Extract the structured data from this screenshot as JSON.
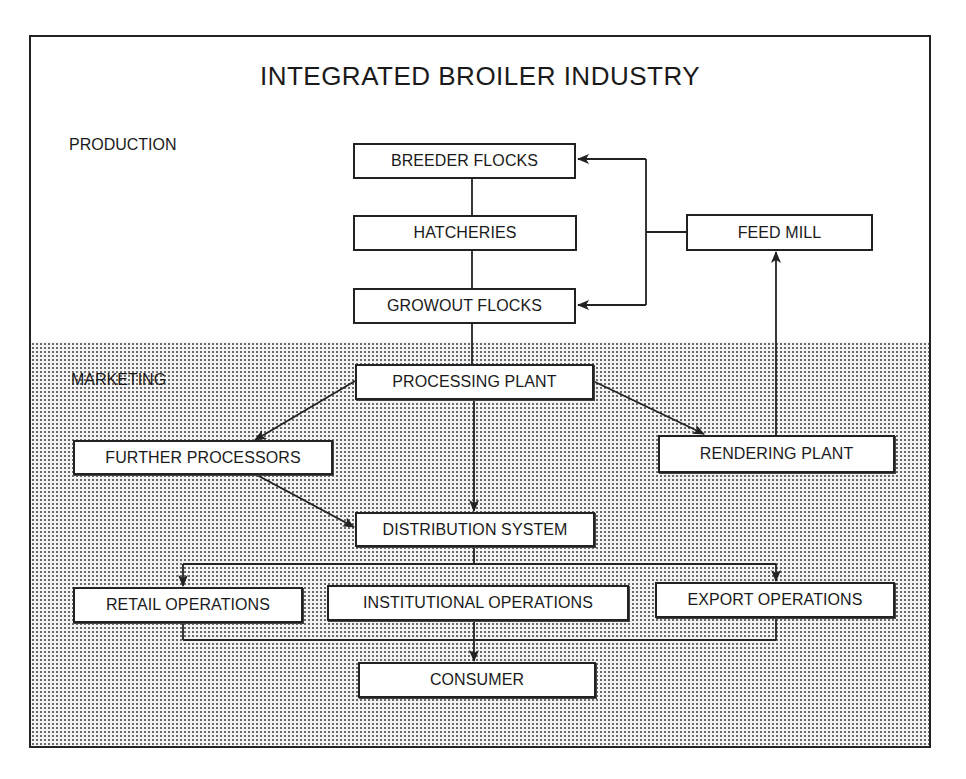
{
  "diagram": {
    "title": "INTEGRATED BROILER INDUSTRY",
    "sections": {
      "production": "PRODUCTION",
      "marketing": "MARKETING"
    },
    "nodes": {
      "breeder_flocks": "BREEDER FLOCKS",
      "hatcheries": "HATCHERIES",
      "growout_flocks": "GROWOUT FLOCKS",
      "feed_mill": "FEED MILL",
      "processing_plant": "PROCESSING PLANT",
      "further_processors": "FURTHER PROCESSORS",
      "rendering_plant": "RENDERING PLANT",
      "distribution_system": "DISTRIBUTION SYSTEM",
      "retail_operations": "RETAIL OPERATIONS",
      "institutional_operations": "INSTITUTIONAL OPERATIONS",
      "export_operations": "EXPORT OPERATIONS",
      "consumer": "CONSUMER"
    },
    "edges": [
      {
        "from": "breeder_flocks",
        "to": "hatcheries",
        "arrow": false
      },
      {
        "from": "hatcheries",
        "to": "growout_flocks",
        "arrow": false
      },
      {
        "from": "feed_mill",
        "to": "breeder_flocks",
        "arrow": true
      },
      {
        "from": "feed_mill",
        "to": "growout_flocks",
        "arrow": true
      },
      {
        "from": "growout_flocks",
        "to": "processing_plant",
        "arrow": false
      },
      {
        "from": "processing_plant",
        "to": "further_processors",
        "arrow": true
      },
      {
        "from": "processing_plant",
        "to": "rendering_plant",
        "arrow": true
      },
      {
        "from": "processing_plant",
        "to": "distribution_system",
        "arrow": true
      },
      {
        "from": "rendering_plant",
        "to": "feed_mill",
        "arrow": true
      },
      {
        "from": "further_processors",
        "to": "distribution_system",
        "arrow": true
      },
      {
        "from": "distribution_system",
        "to": "retail_operations",
        "arrow": true
      },
      {
        "from": "distribution_system",
        "to": "institutional_operations",
        "arrow": false
      },
      {
        "from": "distribution_system",
        "to": "export_operations",
        "arrow": true
      },
      {
        "from": "retail_operations",
        "to": "consumer",
        "arrow": true
      },
      {
        "from": "institutional_operations",
        "to": "consumer",
        "arrow": true
      },
      {
        "from": "export_operations",
        "to": "consumer",
        "arrow": true
      }
    ],
    "colors": {
      "line": "#222222",
      "box_fill": "#ffffff",
      "shade_dot": "#6a6a6a",
      "background": "#ffffff"
    }
  }
}
